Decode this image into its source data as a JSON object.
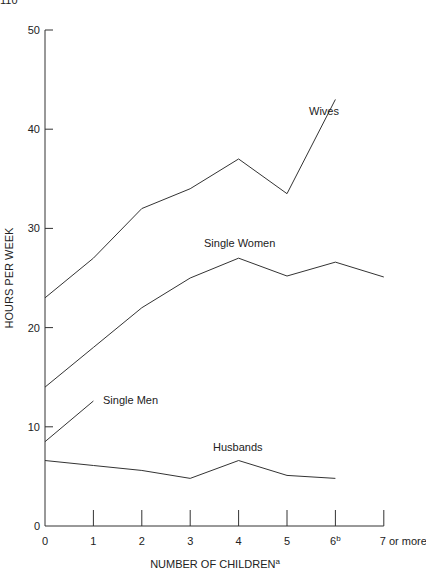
{
  "corner_text": "110",
  "chart_data": {
    "type": "line",
    "title": "",
    "xlabel": "NUMBER OF CHILDREN",
    "xlabel_superscript": "a",
    "ylabel": "HOURS PER WEEK",
    "categories": [
      "0",
      "1",
      "2",
      "3",
      "4",
      "5",
      "6",
      "7 or more"
    ],
    "category_superscripts": {
      "6": "b"
    },
    "ylim": [
      0,
      50
    ],
    "yticks": [
      0,
      10,
      20,
      30,
      40,
      50
    ],
    "grid": false,
    "legend": "inline labels",
    "series": [
      {
        "name": "Wives",
        "values": [
          23,
          27,
          32,
          34,
          37,
          33.5,
          43,
          null
        ]
      },
      {
        "name": "Single Women",
        "values": [
          14,
          18,
          22,
          25,
          27,
          25.2,
          26.6,
          25.1
        ]
      },
      {
        "name": "Single Men",
        "values": [
          8.5,
          12.6,
          null,
          null,
          null,
          null,
          null,
          null
        ]
      },
      {
        "name": "Husbands",
        "values": [
          6.6,
          6.1,
          5.6,
          4.8,
          6.6,
          5.1,
          4.8,
          null
        ]
      }
    ]
  }
}
